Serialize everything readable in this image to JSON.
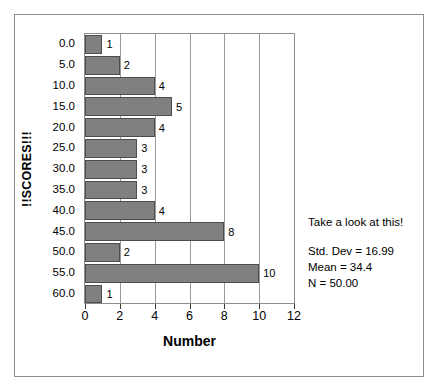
{
  "chart_data": {
    "type": "bar",
    "orientation": "horizontal",
    "title": "",
    "xlabel": "Number",
    "ylabel": "!!SCORES!!!",
    "categories": [
      "0.0",
      "5.0",
      "10.0",
      "15.0",
      "20.0",
      "25.0",
      "30.0",
      "35.0",
      "40.0",
      "45.0",
      "50.0",
      "55.0",
      "60.0"
    ],
    "values": [
      1,
      2,
      4,
      5,
      4,
      3,
      3,
      3,
      4,
      8,
      2,
      10,
      1
    ],
    "data_labels": [
      "1",
      "2",
      "4",
      "5",
      "4",
      "3",
      "3",
      "3",
      "4",
      "8",
      "2",
      "10",
      "1"
    ],
    "xlim": [
      0,
      12
    ],
    "x_ticks": [
      "0",
      "2",
      "4",
      "6",
      "8",
      "10",
      "12"
    ],
    "x_tick_values": [
      0,
      2,
      4,
      6,
      8,
      10,
      12
    ],
    "grid": "vertical",
    "legend": "none",
    "bar_color": "#808080",
    "bar_edge_color": "#4d4d4d",
    "plot_background": "#ffffff",
    "axis_color": "#8d8d8d",
    "annotations": {
      "headline": "Take a look at this!",
      "stats": [
        "Std. Dev = 16.99",
        "Mean = 34.4",
        "N = 50.00"
      ]
    }
  }
}
